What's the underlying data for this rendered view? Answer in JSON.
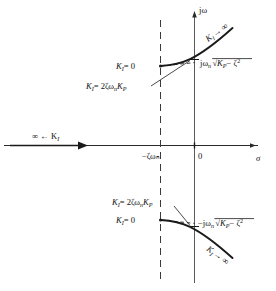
{
  "figure": {
    "kind": "root-locus-plot",
    "axes": {
      "imaginary_axis_label": "jω",
      "real_axis_label": "σ",
      "origin_label": "0",
      "asymptote_label_prefix": "−",
      "asymptote_label_zeta": "ζ",
      "asymptote_label_omega": "ω",
      "asymptote_label_omega_sub": "n",
      "asymptote_value": "−ζωₙ"
    },
    "labels": {
      "upper_branch_infinity": "K",
      "upper_branch_infinity_sub": "I",
      "upper_branch_infinity_arrow": "→ ∞",
      "lower_branch_infinity": "K",
      "lower_branch_infinity_sub": "I",
      "lower_branch_infinity_arrow": "→ ∞",
      "real_axis_branch": "∞ ← K",
      "real_axis_branch_sub": "I",
      "ki_zero_upper": "K",
      "ki_zero_upper_sub": "I",
      "ki_zero_upper_value": "= 0",
      "ki_zero_lower": "K",
      "ki_zero_lower_sub": "I",
      "ki_zero_lower_value": "= 0",
      "ki_crossing_upper": "K",
      "ki_crossing_upper_sub": "I",
      "ki_crossing_upper_value": "= 2ζω",
      "ki_crossing_upper_omega_sub": "n",
      "ki_crossing_upper_kp": "K",
      "ki_crossing_upper_kp_sub": "P",
      "ki_crossing_lower": "K",
      "ki_crossing_lower_sub": "I",
      "ki_crossing_lower_value": "= 2ζω",
      "ki_crossing_lower_omega_sub": "n",
      "ki_crossing_lower_kp": "K",
      "ki_crossing_lower_kp_sub": "P",
      "crossing_upper_imag": "jω",
      "crossing_upper_imag_sub": "n",
      "crossing_upper_radical_kp": "K",
      "crossing_upper_radical_kp_sub": "P",
      "crossing_upper_radical_rest": "− ζ",
      "crossing_upper_radical_exp": "2",
      "crossing_lower_imag": "−jω",
      "crossing_lower_imag_sub": "n",
      "crossing_lower_radical_kp": "K",
      "crossing_lower_radical_kp_sub": "P",
      "crossing_lower_radical_rest": "− ζ",
      "crossing_lower_radical_exp": "2"
    },
    "colors": {
      "line": "#1a1a1a",
      "axis": "#4a4a4a",
      "background": "#ffffff"
    }
  }
}
